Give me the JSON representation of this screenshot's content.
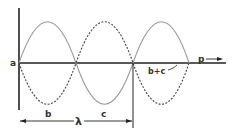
{
  "diagram": {
    "title": "",
    "labels": {
      "origin": "a",
      "axis": "p",
      "wave_b": "b",
      "wave_c": "c",
      "sum": "b+c",
      "wavelength": "λ"
    },
    "colors": {
      "axis": "#222222",
      "wave_solid": "#999999",
      "wave_dashed": "#444444",
      "background": "#ffffff"
    }
  }
}
